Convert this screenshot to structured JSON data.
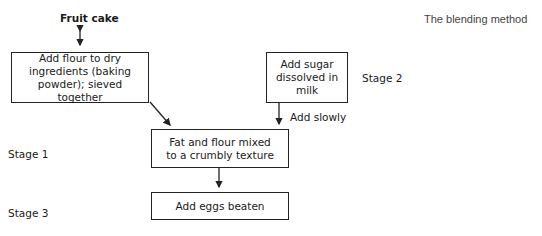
{
  "diagram": {
    "title": "The blending method",
    "top_label": "Fruit cake",
    "boxes": {
      "flour": "Add flour to dry ingredients (baking powder); sieved together",
      "sugar": "Add sugar dissolved in milk",
      "fat": "Fat and flour mixed to a crumbly texture",
      "eggs": "Add eggs beaten"
    },
    "edge_labels": {
      "sugar_to_fat": "Add slowly"
    },
    "stages": {
      "stage1": "Stage 1",
      "stage2": "Stage 2",
      "stage3": "Stage 3"
    }
  }
}
